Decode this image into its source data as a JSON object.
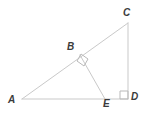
{
  "figure": {
    "kind": "euclidean-geometry-diagram",
    "width": 145,
    "height": 118,
    "background_color": "#ffffff",
    "stroke_color": "#c9c9c9",
    "stroke_width": 1,
    "label_color": "#3b3b3b",
    "label_font_size": 10
  },
  "vertices": [
    {
      "id": "A",
      "label": "A",
      "x": 22,
      "y": 99,
      "label_x": 8,
      "label_y": 95
    },
    {
      "id": "B",
      "label": "B",
      "x": 80,
      "y": 55,
      "label_x": 67,
      "label_y": 42
    },
    {
      "id": "C",
      "label": "C",
      "x": 128,
      "y": 23,
      "label_x": 123,
      "label_y": 8
    },
    {
      "id": "D",
      "label": "D",
      "x": 128,
      "y": 99,
      "label_x": 131,
      "label_y": 92
    },
    {
      "id": "E",
      "label": "E",
      "x": 105,
      "y": 99,
      "label_x": 103,
      "label_y": 99
    }
  ],
  "segments": [
    {
      "id": "AC",
      "from": "A",
      "to": "C",
      "x1": 22,
      "y1": 99,
      "x2": 128,
      "y2": 23
    },
    {
      "id": "AD",
      "from": "A",
      "to": "D",
      "x1": 22,
      "y1": 99,
      "x2": 128,
      "y2": 99
    },
    {
      "id": "CD",
      "from": "C",
      "to": "D",
      "x1": 128,
      "y1": 23,
      "x2": 128,
      "y2": 99
    },
    {
      "id": "BE",
      "from": "B",
      "to": "E",
      "x1": 80,
      "y1": 55,
      "x2": 105,
      "y2": 99
    }
  ],
  "right_angle_marks": [
    {
      "id": "right-angle-at-B",
      "at_vertex": "B",
      "points": "81,54 88,59 84,66 77,61",
      "size": 8
    },
    {
      "id": "right-angle-at-D",
      "at_vertex": "D",
      "points": "120,91 128,91 128,99 120,99",
      "size": 8
    }
  ]
}
